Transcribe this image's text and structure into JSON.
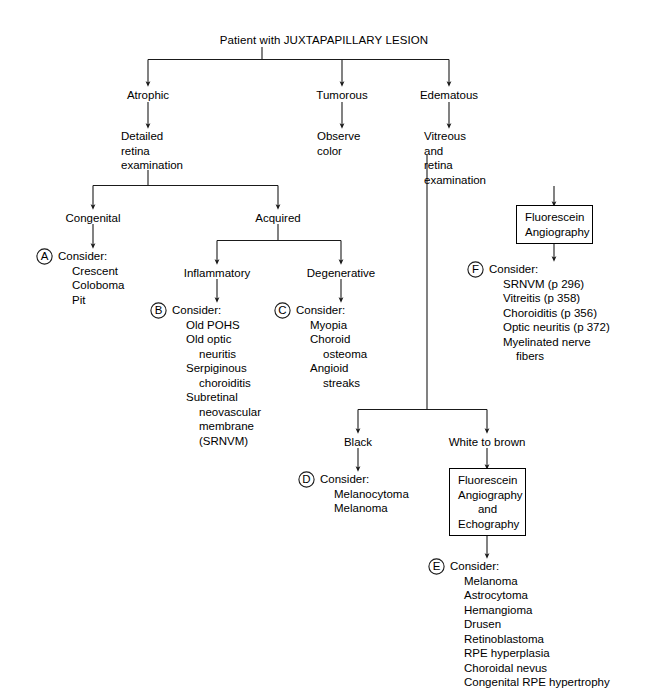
{
  "diagram": {
    "title": "Patient with JUXTAPAPILLARY LESION",
    "root_label": "Patient with JUXTAPAPILLARY LESION",
    "line_color": "#1a1a1a",
    "background": "#ffffff",
    "text_color": "#000000"
  },
  "nodes": {
    "atrophic": "Atrophic",
    "tumorous": "Tumorous",
    "edematous": "Edematous",
    "detailed_retina_examination": "Detailed\nretina\nexamination",
    "observe_color": "Observe\ncolor",
    "vitreous_and_retina_examination": "Vitreous\nand\nretina\nexamination",
    "congenital": "Congenital",
    "acquired": "Acquired",
    "inflammatory": "Inflammatory",
    "degenerative": "Degenerative",
    "black": "Black",
    "white_to_brown": "White to brown"
  },
  "boxes": {
    "fluorescein_angiography": "Fluorescein\nAngiography",
    "fluorescein_angiography_and_echography": "Fluorescein\nAngiography\nand\nEchography"
  },
  "consider_blocks": [
    {
      "marker": "A",
      "heading": "Consider:",
      "items": [
        {
          "text": "Crescent",
          "indent": 0
        },
        {
          "text": "Coloboma",
          "indent": 0
        },
        {
          "text": "Pit",
          "indent": 0
        }
      ]
    },
    {
      "marker": "B",
      "heading": "Consider:",
      "items": [
        {
          "text": "Old POHS",
          "indent": 0
        },
        {
          "text": "Old optic",
          "indent": 0
        },
        {
          "text": "neuritis",
          "indent": 1
        },
        {
          "text": "Serpiginous",
          "indent": 0
        },
        {
          "text": "choroiditis",
          "indent": 1
        },
        {
          "text": "Subretinal",
          "indent": 0
        },
        {
          "text": "neovascular",
          "indent": 1
        },
        {
          "text": "membrane",
          "indent": 1
        },
        {
          "text": "(SRNVM)",
          "indent": 1
        }
      ]
    },
    {
      "marker": "C",
      "heading": "Consider:",
      "items": [
        {
          "text": "Myopia",
          "indent": 0
        },
        {
          "text": "Choroid",
          "indent": 0
        },
        {
          "text": "osteoma",
          "indent": 1
        },
        {
          "text": "Angioid",
          "indent": 0
        },
        {
          "text": "streaks",
          "indent": 1
        }
      ]
    },
    {
      "marker": "D",
      "heading": "Consider:",
      "items": [
        {
          "text": "Melanocytoma",
          "indent": 0
        },
        {
          "text": "Melanoma",
          "indent": 0
        }
      ]
    },
    {
      "marker": "E",
      "heading": "Consider:",
      "items": [
        {
          "text": "Melanoma",
          "indent": 0
        },
        {
          "text": "Astrocytoma",
          "indent": 0
        },
        {
          "text": "Hemangioma",
          "indent": 0
        },
        {
          "text": "Drusen",
          "indent": 0
        },
        {
          "text": "Retinoblastoma",
          "indent": 0
        },
        {
          "text": "RPE hyperplasia",
          "indent": 0
        },
        {
          "text": "Choroidal nevus",
          "indent": 0
        },
        {
          "text": "Congenital RPE hypertrophy",
          "indent": 0
        }
      ]
    },
    {
      "marker": "F",
      "heading": "Consider:",
      "items": [
        {
          "text": "SRNVM (p 296)",
          "indent": 0
        },
        {
          "text": "Vitreitis (p 358)",
          "indent": 0
        },
        {
          "text": "Choroiditis (p 356)",
          "indent": 0
        },
        {
          "text": "Optic neuritis (p 372)",
          "indent": 0
        },
        {
          "text": "Myelinated nerve",
          "indent": 0
        },
        {
          "text": "fibers",
          "indent": 1
        }
      ]
    }
  ]
}
